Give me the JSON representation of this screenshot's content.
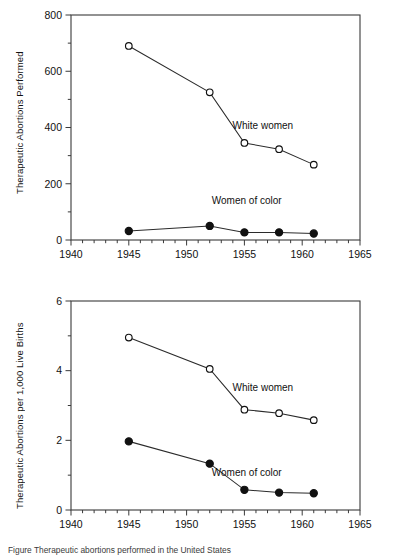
{
  "figure": {
    "caption": "Figure    Therapeutic abortions performed in the United States"
  },
  "charts": [
    {
      "id": "abortions-performed",
      "ylabel_line1": "Therapeutic Abortions",
      "ylabel_line2": "Performed",
      "series_labels": {
        "white": "White women",
        "color": "Women of color"
      },
      "xticks": [
        "1940",
        "1945",
        "1950",
        "1955",
        "1960",
        "1965"
      ],
      "yticks": [
        "0",
        "200",
        "400",
        "600",
        "800"
      ]
    },
    {
      "id": "abortions-per-1000-live-births",
      "ylabel_line1": "Therapeutic Abortions",
      "ylabel_line2": "per 1,000 Live Births",
      "series_labels": {
        "white": "White women",
        "color": "Women of color"
      },
      "xticks": [
        "1940",
        "1945",
        "1950",
        "1955",
        "1960",
        "1965"
      ],
      "yticks": [
        "0",
        "2",
        "4",
        "6"
      ]
    }
  ],
  "chart_data": [
    {
      "type": "line",
      "title": "",
      "xlabel": "",
      "ylabel": "Therapeutic Abortions Performed",
      "xlim": [
        1940,
        1965
      ],
      "ylim": [
        0,
        800
      ],
      "xticks": [
        1940,
        1945,
        1950,
        1955,
        1960,
        1965
      ],
      "yticks": [
        0,
        200,
        400,
        600,
        800
      ],
      "xminor_step": 1,
      "yminor_step": 100,
      "grid": false,
      "legend": "inline-annotations",
      "x": [
        1945,
        1952,
        1955,
        1958,
        1961
      ],
      "series": [
        {
          "name": "White women",
          "marker": "open-circle",
          "values": [
            690,
            525,
            345,
            323,
            268
          ]
        },
        {
          "name": "Women of color",
          "marker": "filled-circle",
          "values": [
            32,
            50,
            27,
            27,
            23
          ]
        }
      ],
      "annotations": [
        {
          "text": "White women",
          "x": 1956.6,
          "y": 395
        },
        {
          "text": "Women of color",
          "x": 1955.2,
          "y": 128
        }
      ]
    },
    {
      "type": "line",
      "title": "",
      "xlabel": "",
      "ylabel": "Therapeutic Abortions per 1,000 Live Births",
      "xlim": [
        1940,
        1965
      ],
      "ylim": [
        0,
        6
      ],
      "xticks": [
        1940,
        1945,
        1950,
        1955,
        1960,
        1965
      ],
      "yticks": [
        0,
        2,
        4,
        6
      ],
      "xminor_step": 1,
      "yminor_step": 1,
      "grid": false,
      "legend": "inline-annotations",
      "x": [
        1945,
        1952,
        1955,
        1958,
        1961
      ],
      "series": [
        {
          "name": "White women",
          "marker": "open-circle",
          "values": [
            4.95,
            4.05,
            2.88,
            2.78,
            2.58
          ]
        },
        {
          "name": "Women of color",
          "marker": "filled-circle",
          "values": [
            1.97,
            1.33,
            0.58,
            0.5,
            0.48
          ]
        }
      ],
      "annotations": [
        {
          "text": "White women",
          "x": 1956.6,
          "y": 3.42
        },
        {
          "text": "Women of color",
          "x": 1955.2,
          "y": 0.98
        }
      ]
    }
  ]
}
